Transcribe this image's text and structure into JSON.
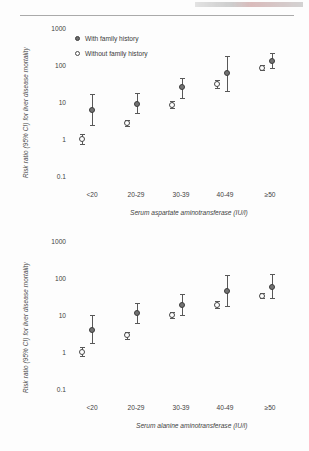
{
  "figure": {
    "legend": [
      {
        "label": "With family history",
        "marker": "filled-circle"
      },
      {
        "label": "Without family history",
        "marker": "open-circle"
      }
    ],
    "y_axis_label": "Risk ratio (95% CI) for liver disease mortality",
    "y_ticks": [
      "1000",
      "100",
      "10",
      "1",
      "0.1"
    ],
    "x_ticks": [
      "<20",
      "20-29",
      "30-39",
      "40-49",
      "≥50"
    ],
    "colors": {
      "with_family_history_fill": "#737373",
      "with_family_history_edge": "#3c3c3c",
      "without_family_history_fill": "#ffffff",
      "without_family_history_edge": "#474747",
      "error_bar": "#585858",
      "text": "#3a3a3a"
    }
  },
  "chart_data": [
    {
      "id": "ast-panel",
      "type": "scatter",
      "title": "",
      "xlabel": "Serum aspartate aminotransferase (IU/l)",
      "ylabel": "Risk ratio (95% CI) for liver disease mortality",
      "yscale": "log",
      "ylim": [
        0.1,
        1000
      ],
      "yticks": [
        0.1,
        1,
        10,
        100,
        1000
      ],
      "ytick_labels": [
        "0.1",
        "1",
        "10",
        "100",
        "1000"
      ],
      "grid": false,
      "legend_position": "top-left",
      "categories": [
        "<20",
        "20-29",
        "30-39",
        "40-49",
        "≥50"
      ],
      "series": [
        {
          "name": "Without family history",
          "marker": "open-circle",
          "values": [
            1.0,
            2.7,
            8.5,
            30,
            85
          ],
          "ci_low": [
            0.75,
            2.2,
            7.0,
            24,
            72
          ],
          "ci_high": [
            1.4,
            3.3,
            10.5,
            39,
            100
          ]
        },
        {
          "name": "With family history",
          "marker": "filled-circle",
          "values": [
            6.0,
            9.0,
            25,
            60,
            130
          ],
          "ci_low": [
            2.4,
            5.0,
            13,
            20,
            85
          ],
          "ci_high": [
            16,
            17,
            45,
            175,
            210
          ]
        }
      ]
    },
    {
      "id": "alt-panel",
      "type": "scatter",
      "title": "",
      "xlabel": "Serum alanine aminotransferase (IU/l)",
      "ylabel": "Risk ratio (95% CI) for liver disease mortality",
      "yscale": "log",
      "ylim": [
        0.1,
        1000
      ],
      "yticks": [
        0.1,
        1,
        10,
        100,
        1000
      ],
      "ytick_labels": [
        "0.1",
        "1",
        "10",
        "100",
        "1000"
      ],
      "grid": false,
      "legend_position": "none",
      "categories": [
        "<20",
        "20-29",
        "30-39",
        "40-49",
        "≥50"
      ],
      "series": [
        {
          "name": "Without family history",
          "marker": "open-circle",
          "values": [
            1.0,
            2.8,
            10.0,
            19,
            33
          ],
          "ci_low": [
            0.78,
            2.3,
            8.3,
            15,
            28
          ],
          "ci_high": [
            1.35,
            3.4,
            12.0,
            24,
            40
          ]
        },
        {
          "name": "With family history",
          "marker": "filled-circle",
          "values": [
            4.0,
            11.0,
            19,
            45,
            58
          ],
          "ci_low": [
            1.7,
            6.0,
            10,
            18,
            28
          ],
          "ci_high": [
            10.0,
            21,
            38,
            120,
            125
          ]
        }
      ]
    }
  ]
}
